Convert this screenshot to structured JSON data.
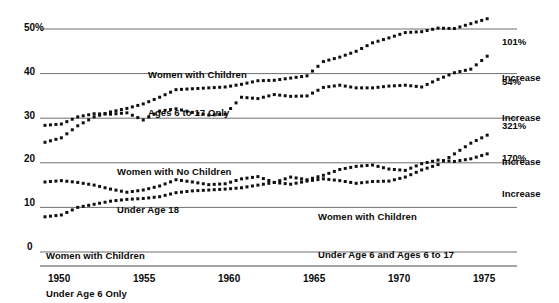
{
  "chart_data": {
    "type": "scatter",
    "title": "",
    "subtitle": "",
    "xlabel": "",
    "ylabel": "",
    "xlim": [
      1948,
      1975
    ],
    "ylim": [
      0,
      50
    ],
    "grid": true,
    "grid_values": [
      0,
      10,
      20,
      30,
      40,
      50
    ],
    "legend_position": "inline-annotations",
    "x_ticks": [
      "1950",
      "1955",
      "1960",
      "1965",
      "1970",
      "1975"
    ],
    "x_tick_values": [
      1950,
      1955,
      1960,
      1965,
      1970,
      1975
    ],
    "y_ticks": [
      "0",
      "10",
      "20",
      "30",
      "40",
      "50%"
    ],
    "y_tick_values": [
      0,
      10,
      20,
      30,
      40,
      50
    ],
    "marker": "square-dot",
    "series": [
      {
        "name": "Women with Children Ages 6 to 17 Only",
        "annotation": "Women with Children\nAges 6 to 17 Only",
        "increase_label": "101%",
        "increase_suffix": "Increase",
        "x": [
          1948,
          1949,
          1950,
          1951,
          1952,
          1953,
          1954,
          1955,
          1956,
          1957,
          1958,
          1959,
          1960,
          1961,
          1962,
          1963,
          1964,
          1965,
          1966,
          1967,
          1968,
          1969,
          1970,
          1971,
          1972,
          1973,
          1974,
          1975
        ],
        "y": [
          24.6,
          25.6,
          28.3,
          30.3,
          31.4,
          32.2,
          33.2,
          34.7,
          36.4,
          36.6,
          36.8,
          37.0,
          37.6,
          38.4,
          38.5,
          39.0,
          39.5,
          42.7,
          43.7,
          45.0,
          46.9,
          48.0,
          49.2,
          49.4,
          50.2,
          50.1,
          51.2,
          52.3
        ]
      },
      {
        "name": "Women with No Children Under Age 18",
        "annotation": "Women with No Children\nUnder Age 18",
        "increase_label": "54%",
        "increase_suffix": "Increase",
        "x": [
          1948,
          1949,
          1950,
          1951,
          1952,
          1953,
          1954,
          1955,
          1956,
          1957,
          1958,
          1959,
          1960,
          1961,
          1962,
          1963,
          1964,
          1965,
          1966,
          1967,
          1968,
          1969,
          1970,
          1971,
          1972,
          1973,
          1974,
          1975
        ],
        "y": [
          28.4,
          28.7,
          30.3,
          31.0,
          30.9,
          31.2,
          29.6,
          31.6,
          32.1,
          31.3,
          30.7,
          30.9,
          34.7,
          34.4,
          35.3,
          34.9,
          35.0,
          36.9,
          37.4,
          36.8,
          36.8,
          37.2,
          37.4,
          37.0,
          38.7,
          40.2,
          41.0,
          43.9
        ]
      },
      {
        "name": "Women with Children Under Age 6 and Ages 6 to 17",
        "annotation": "Women with Children\nUnder Age 6 and Ages 6 to 17",
        "increase_label": "321%",
        "increase_suffix": "Increase",
        "x": [
          1948,
          1949,
          1950,
          1951,
          1952,
          1953,
          1954,
          1955,
          1956,
          1957,
          1958,
          1959,
          1960,
          1961,
          1962,
          1963,
          1964,
          1965,
          1966,
          1967,
          1968,
          1969,
          1970,
          1971,
          1972,
          1973,
          1974,
          1975
        ],
        "y": [
          7.9,
          8.3,
          10.0,
          10.7,
          11.4,
          11.8,
          12.0,
          12.4,
          13.3,
          13.7,
          13.9,
          14.1,
          14.4,
          15.0,
          15.6,
          15.2,
          15.9,
          16.4,
          16.0,
          15.4,
          15.8,
          15.9,
          16.8,
          18.4,
          19.6,
          22.0,
          24.4,
          26.2
        ]
      },
      {
        "name": "Women with Children Under Age 6 Only",
        "annotation": "Women with Children\nUnder Age 6 Only",
        "increase_label": "170%",
        "increase_suffix": "Increase",
        "x": [
          1948,
          1949,
          1950,
          1951,
          1952,
          1953,
          1954,
          1955,
          1956,
          1957,
          1958,
          1959,
          1960,
          1961,
          1962,
          1963,
          1964,
          1965,
          1966,
          1967,
          1968,
          1969,
          1970,
          1971,
          1972,
          1973,
          1974,
          1975
        ],
        "y": [
          15.7,
          16.0,
          15.6,
          15.0,
          14.1,
          13.4,
          13.9,
          14.8,
          16.2,
          15.7,
          15.1,
          15.3,
          16.4,
          16.9,
          15.6,
          16.8,
          16.2,
          17.2,
          18.5,
          19.2,
          19.5,
          18.6,
          18.3,
          19.8,
          20.6,
          20.3,
          20.9,
          22.0
        ]
      }
    ]
  },
  "axes": {
    "y_labels": [
      {
        "text": "50%",
        "value": 50
      },
      {
        "text": "40",
        "value": 40
      },
      {
        "text": "30",
        "value": 30
      },
      {
        "text": "20",
        "value": 20
      },
      {
        "text": "10",
        "value": 10
      },
      {
        "text": "0",
        "value": 0
      }
    ],
    "x_labels": [
      {
        "text": "1950",
        "value": 1950
      },
      {
        "text": "1955",
        "value": 1955
      },
      {
        "text": "1960",
        "value": 1960
      },
      {
        "text": "1965",
        "value": 1965
      },
      {
        "text": "1970",
        "value": 1970
      },
      {
        "text": "1975",
        "value": 1975
      }
    ]
  },
  "annotations": {
    "series1_line1": "Women with Children",
    "series1_line2": "Ages 6 to 17 Only",
    "series2_line1": "Women with No Children",
    "series2_line2": "Under Age 18",
    "series3_line1": "Women with Children",
    "series3_line2": "Under Age 6 and Ages 6 to 17",
    "series4_line1": "Women with Children",
    "series4_line2": "Under Age 6 Only"
  },
  "right_labels": [
    {
      "pct": "101%",
      "word": "Increase"
    },
    {
      "pct": "54%",
      "word": "Increase"
    },
    {
      "pct": "321%",
      "word": "Increase"
    },
    {
      "pct": "170%",
      "word": "Increase"
    }
  ],
  "colors": {
    "marker": "#111111",
    "grid": "#6f6f6f",
    "axis": "#4a4a4a",
    "text": "#0a0a0a",
    "background": "#ffffff"
  }
}
